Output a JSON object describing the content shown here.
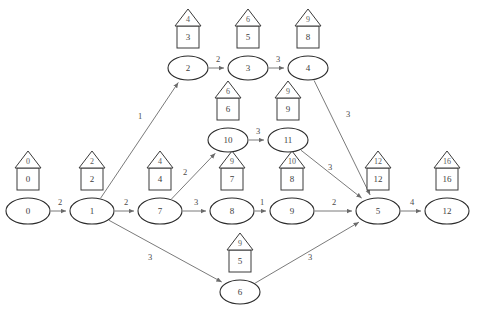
{
  "diagram": {
    "type": "directed-weighted-graph",
    "title": "",
    "node_shape": "ellipse",
    "annotation_shapes": [
      "triangle",
      "square"
    ],
    "colors": {
      "background": "#ffffff",
      "node_stroke": "#2b2b2b",
      "edge_stroke": "#6b6b6b",
      "annotation_stroke": "#3a3a3a",
      "text": "#3d3d3d"
    },
    "nodes": [
      {
        "id": "0",
        "label": "0",
        "x": 28,
        "y": 211,
        "rx": 22,
        "ry": 13,
        "tri": "0",
        "box": "0"
      },
      {
        "id": "1",
        "label": "1",
        "x": 92,
        "y": 211,
        "rx": 22,
        "ry": 13,
        "tri": "2",
        "box": "2"
      },
      {
        "id": "7",
        "label": "7",
        "x": 160,
        "y": 211,
        "rx": 22,
        "ry": 13,
        "tri": "4",
        "box": "4"
      },
      {
        "id": "8",
        "label": "8",
        "x": 232,
        "y": 211,
        "rx": 22,
        "ry": 13,
        "tri": "9",
        "box": "7"
      },
      {
        "id": "9",
        "label": "9",
        "x": 292,
        "y": 211,
        "rx": 22,
        "ry": 13,
        "tri": "10",
        "box": "8"
      },
      {
        "id": "5",
        "label": "5",
        "x": 378,
        "y": 211,
        "rx": 22,
        "ry": 13,
        "tri": "12",
        "box": "12"
      },
      {
        "id": "12",
        "label": "12",
        "x": 447,
        "y": 211,
        "rx": 22,
        "ry": 13,
        "tri": "16",
        "box": "16"
      },
      {
        "id": "2",
        "label": "2",
        "x": 188,
        "y": 68,
        "rx": 20,
        "ry": 12,
        "tri": "4",
        "box": "3"
      },
      {
        "id": "3",
        "label": "3",
        "x": 248,
        "y": 68,
        "rx": 20,
        "ry": 12,
        "tri": "6",
        "box": "5"
      },
      {
        "id": "4",
        "label": "4",
        "x": 308,
        "y": 68,
        "rx": 20,
        "ry": 12,
        "tri": "9",
        "box": "8"
      },
      {
        "id": "10",
        "label": "10",
        "x": 228,
        "y": 140,
        "rx": 20,
        "ry": 12,
        "tri": "6",
        "box": "6"
      },
      {
        "id": "11",
        "label": "11",
        "x": 288,
        "y": 140,
        "rx": 20,
        "ry": 12,
        "tri": "9",
        "box": "9"
      },
      {
        "id": "6",
        "label": "6",
        "x": 240,
        "y": 292,
        "rx": 20,
        "ry": 12,
        "tri": "9",
        "box": "5"
      }
    ],
    "edges": [
      {
        "from": "0",
        "to": "1",
        "weight": "2",
        "lx": 60,
        "ly": 203
      },
      {
        "from": "1",
        "to": "7",
        "weight": "2",
        "lx": 126,
        "ly": 203
      },
      {
        "from": "7",
        "to": "8",
        "weight": "3",
        "lx": 196,
        "ly": 203
      },
      {
        "from": "8",
        "to": "9",
        "weight": "1",
        "lx": 262,
        "ly": 203
      },
      {
        "from": "9",
        "to": "5",
        "weight": "2",
        "lx": 334,
        "ly": 203
      },
      {
        "from": "5",
        "to": "12",
        "weight": "4",
        "lx": 412,
        "ly": 203
      },
      {
        "from": "1",
        "to": "2",
        "weight": "1",
        "lx": 140,
        "ly": 117
      },
      {
        "from": "2",
        "to": "3",
        "weight": "2",
        "lx": 218,
        "ly": 60
      },
      {
        "from": "3",
        "to": "4",
        "weight": "3",
        "lx": 278,
        "ly": 60
      },
      {
        "from": "4",
        "to": "5",
        "weight": "3",
        "lx": 348,
        "ly": 115
      },
      {
        "from": "7",
        "to": "10",
        "weight": "2",
        "lx": 185,
        "ly": 173
      },
      {
        "from": "10",
        "to": "11",
        "weight": "3",
        "lx": 258,
        "ly": 132
      },
      {
        "from": "11",
        "to": "5",
        "weight": "3",
        "lx": 330,
        "ly": 168
      },
      {
        "from": "1",
        "to": "6",
        "weight": "3",
        "lx": 150,
        "ly": 258
      },
      {
        "from": "6",
        "to": "5",
        "weight": "3",
        "lx": 310,
        "ly": 258
      }
    ]
  }
}
